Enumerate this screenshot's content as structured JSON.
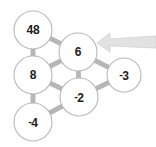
{
  "figure": {
    "type": "number-lattice-puzzle",
    "background_color": "#ffffff",
    "width": 156,
    "height": 147
  },
  "style": {
    "node_fill": "#ffffff",
    "node_stroke": "#b8b8b8",
    "edge_color": "#b0b0b0",
    "edge_highlight": "#d8d8d8",
    "text_color": "#1c1c1c",
    "arrow_color": "#e2e2e2",
    "arrow_edge_color": "#d0d0d0"
  },
  "nodes": [
    {
      "id": "n48",
      "name": "node-48",
      "value": "48",
      "sign": "",
      "digits": "48",
      "cx": 33,
      "cy": 30,
      "r": 19
    },
    {
      "id": "n6",
      "name": "node-6",
      "value": "6",
      "sign": "",
      "digits": "6",
      "cx": 78,
      "cy": 52,
      "r": 19
    },
    {
      "id": "n8",
      "name": "node-8",
      "value": "8",
      "sign": "",
      "digits": "8",
      "cx": 33,
      "cy": 75,
      "r": 19
    },
    {
      "id": "nm3",
      "name": "node-minus-3",
      "value": "-3",
      "sign": "-",
      "digits": "3",
      "cx": 124,
      "cy": 75,
      "r": 17
    },
    {
      "id": "nm2",
      "name": "node-minus-2",
      "value": "-2",
      "sign": "-",
      "digits": "2",
      "cx": 79,
      "cy": 97,
      "r": 19
    },
    {
      "id": "nm4",
      "name": "node-minus-4",
      "value": "-4",
      "sign": "-",
      "digits": "4",
      "cx": 33,
      "cy": 122,
      "r": 19
    }
  ],
  "edges": [
    {
      "name": "edge-48-6",
      "from": "n48",
      "to": "n6"
    },
    {
      "name": "edge-48-8",
      "from": "n48",
      "to": "n8"
    },
    {
      "name": "edge-8-6",
      "from": "n8",
      "to": "n6"
    },
    {
      "name": "edge-6-minus2",
      "from": "n6",
      "to": "nm2"
    },
    {
      "name": "edge-6-minus3",
      "from": "n6",
      "to": "nm3"
    },
    {
      "name": "edge-8-minus2",
      "from": "n8",
      "to": "nm2"
    },
    {
      "name": "edge-minus3-minus2",
      "from": "nm3",
      "to": "nm2"
    },
    {
      "name": "edge-8-minus4",
      "from": "n8",
      "to": "nm4"
    },
    {
      "name": "edge-minus4-minus2",
      "from": "nm4",
      "to": "nm2"
    }
  ],
  "arrow": {
    "name": "pointer-arrow",
    "direction": "left",
    "points_to": "node-6",
    "tip_x": 97,
    "tip_y": 43,
    "tail_x": 156,
    "tail_y": 36
  }
}
